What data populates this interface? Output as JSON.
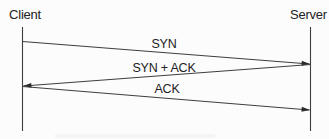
{
  "diagram": {
    "type": "sequence",
    "actors": [
      {
        "id": "client",
        "label": "Client"
      },
      {
        "id": "server",
        "label": "Server"
      }
    ],
    "messages": [
      {
        "label": "SYN",
        "from": "client",
        "to": "server"
      },
      {
        "label": "SYN + ACK",
        "from": "server",
        "to": "client"
      },
      {
        "label": "ACK",
        "from": "client",
        "to": "server"
      }
    ],
    "colors": {
      "line": "#3e3e3e",
      "arrowhead": "#2b2b2b",
      "text": "#222222",
      "background": "#fcfcfc"
    }
  }
}
